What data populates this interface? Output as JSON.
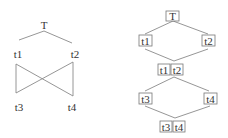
{
  "left_diagram": {
    "nodes": {
      "top": "T",
      "t1": "t1",
      "t2": "t2",
      "t3": "t3",
      "t4": "t4"
    },
    "edges": [
      [
        "T",
        "t1"
      ],
      [
        "T",
        "t2"
      ],
      [
        "t1",
        "t3"
      ],
      [
        "t1",
        "t4"
      ],
      [
        "t2",
        "t3"
      ],
      [
        "t2",
        "t4"
      ]
    ]
  },
  "right_diagram": {
    "nodes": {
      "top": "T",
      "t1": "t1",
      "t2": "t2",
      "join_a": "t1",
      "join_b": "t2",
      "t3": "t3",
      "t4": "t4",
      "bottom_a": "t3",
      "bottom_b": "t4"
    },
    "edges": [
      [
        "T",
        "t1"
      ],
      [
        "T",
        "t2"
      ],
      [
        "t1",
        "t1|t2"
      ],
      [
        "t2",
        "t1|t2"
      ],
      [
        "t1|t2",
        "t3"
      ],
      [
        "t1|t2",
        "t4"
      ],
      [
        "t3",
        "t3|t4"
      ],
      [
        "t4",
        "t3|t4"
      ]
    ]
  },
  "colors": {
    "edge": "#8a8a8a",
    "box_border": "#777777",
    "text": "#333333"
  }
}
